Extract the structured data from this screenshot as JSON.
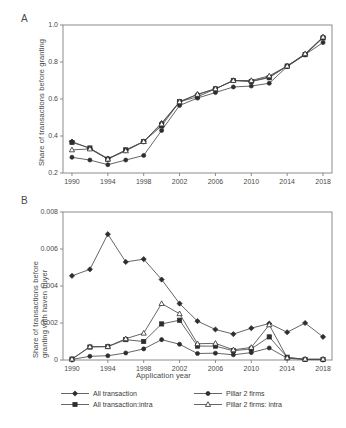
{
  "figure": {
    "width": 346,
    "height": 428,
    "background": "#ffffff",
    "line_color": "#4a4a4a",
    "frame_color": "#8c8c8c"
  },
  "panels": {
    "a": {
      "label": "A"
    },
    "b": {
      "label": "B"
    }
  },
  "legend": {
    "position": "bottom",
    "entries": [
      {
        "label": "All transaction",
        "marker": "diamond-filled"
      },
      {
        "label": "All transaction:intra",
        "marker": "square-filled"
      },
      {
        "label": "Pillar 2 firms",
        "marker": "circle-filled"
      },
      {
        "label": "Pillar 2 firms: intra",
        "marker": "triangle-open"
      }
    ]
  },
  "chart_data": [
    {
      "type": "line",
      "panel": "A",
      "title": "",
      "xlabel": "",
      "ylabel": "Share of transactions before granting",
      "x": [
        1990,
        1992,
        1994,
        1996,
        1998,
        2000,
        2002,
        2004,
        2006,
        2008,
        2010,
        2012,
        2014,
        2016,
        2018
      ],
      "xtick_labels": [
        "1990",
        "1994",
        "1998",
        "2002",
        "2006",
        "2010",
        "2014",
        "2018"
      ],
      "xticks": [
        1990,
        1994,
        1998,
        2002,
        2006,
        2010,
        2014,
        2018
      ],
      "xlim": [
        1989,
        2019
      ],
      "ylim": [
        0.2,
        1.0
      ],
      "yticks": [
        0.2,
        0.4,
        0.6,
        0.8,
        1.0
      ],
      "ytick_labels": [
        "0.2",
        "0.4",
        "0.6",
        "0.8",
        "1.0"
      ],
      "grid": false,
      "series": [
        {
          "name": "All transaction",
          "marker": "diamond-filled",
          "values": [
            0.37,
            0.333,
            0.278,
            0.322,
            0.37,
            0.47,
            0.585,
            0.625,
            0.655,
            0.7,
            0.695,
            0.72,
            0.778,
            0.84,
            0.935
          ]
        },
        {
          "name": "All transaction:intra",
          "marker": "square-filled",
          "values": [
            0.365,
            0.335,
            0.275,
            0.325,
            0.37,
            0.455,
            0.585,
            0.612,
            0.655,
            0.7,
            0.695,
            0.715,
            0.778,
            0.84,
            0.93
          ]
        },
        {
          "name": "Pillar 2 firms",
          "marker": "circle-filled",
          "values": [
            0.285,
            0.27,
            0.245,
            0.27,
            0.295,
            0.43,
            0.565,
            0.605,
            0.635,
            0.665,
            0.67,
            0.685,
            0.775,
            0.84,
            0.905
          ]
        },
        {
          "name": "Pillar 2 firms: intra",
          "marker": "triangle-open",
          "values": [
            0.325,
            0.33,
            0.275,
            0.32,
            0.37,
            0.465,
            0.585,
            0.625,
            0.655,
            0.7,
            0.7,
            0.725,
            0.778,
            0.845,
            0.935
          ]
        }
      ]
    },
    {
      "type": "line",
      "panel": "B",
      "title": "",
      "xlabel": "Application year",
      "ylabel": "Share of transactions before granting with haven buyer",
      "x": [
        1990,
        1992,
        1994,
        1996,
        1998,
        2000,
        2002,
        2004,
        2006,
        2008,
        2010,
        2012,
        2014,
        2016,
        2018
      ],
      "xtick_labels": [
        "1990",
        "1994",
        "1998",
        "2002",
        "2006",
        "2010",
        "2014",
        "2018"
      ],
      "xticks": [
        1990,
        1994,
        1998,
        2002,
        2006,
        2010,
        2014,
        2018
      ],
      "xlim": [
        1989,
        2019
      ],
      "ylim": [
        0,
        0.008
      ],
      "yticks": [
        0,
        0.002,
        0.004,
        0.006,
        0.008
      ],
      "ytick_labels": [
        "0",
        "0.002",
        "0.004",
        "0.006",
        "0.008"
      ],
      "grid": false,
      "series": [
        {
          "name": "All transaction",
          "marker": "diamond-filled",
          "values": [
            0.00455,
            0.0049,
            0.0068,
            0.0053,
            0.00545,
            0.00435,
            0.00305,
            0.0021,
            0.00165,
            0.0014,
            0.00172,
            0.00197,
            0.0015,
            0.002,
            0.00125
          ]
        },
        {
          "name": "All transaction:intra",
          "marker": "square-filled",
          "values": [
            5e-05,
            0.0007,
            0.00072,
            0.0011,
            0.001,
            0.00195,
            0.00215,
            0.00075,
            0.00075,
            0.0005,
            0.0006,
            0.00125,
            0.00015,
            3e-05,
            3e-05
          ]
        },
        {
          "name": "Pillar 2 firms",
          "marker": "circle-filled",
          "values": [
            3e-05,
            0.0002,
            0.00023,
            0.00038,
            0.0006,
            0.0011,
            0.00085,
            0.00035,
            0.00037,
            0.00028,
            0.0004,
            0.00065,
            0.0001,
            2e-05,
            2e-05
          ]
        },
        {
          "name": "Pillar 2 firms: intra",
          "marker": "triangle-open",
          "values": [
            5e-05,
            0.00072,
            0.00073,
            0.00115,
            0.00145,
            0.00305,
            0.0025,
            0.00088,
            0.0009,
            0.00055,
            0.00068,
            0.0019,
            0.00012,
            5e-05,
            5e-05
          ]
        }
      ]
    }
  ],
  "axis_titles": {
    "panel_a_y": "Share of transactions before granting",
    "panel_b_y_line1": "Share of transactions before",
    "panel_b_y_line2": "granting with haven buyer",
    "x": "Application year"
  }
}
